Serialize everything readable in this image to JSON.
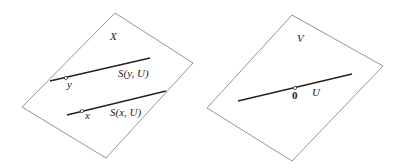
{
  "diagram": {
    "left_panel": {
      "plane_label": "X",
      "plane": [
        [
          115,
          13
        ],
        [
          193,
          63
        ],
        [
          106,
          158
        ],
        [
          22,
          107
        ]
      ],
      "lines": [
        {
          "label": "S(y, U)",
          "from": [
            50,
            81
          ],
          "to": [
            150,
            58
          ],
          "point": [
            66,
            78
          ],
          "point_label": "y"
        },
        {
          "label": "S(x, U)",
          "from": [
            67,
            115
          ],
          "to": [
            166,
            91
          ],
          "point": [
            82,
            111
          ],
          "point_label": "x"
        }
      ]
    },
    "right_panel": {
      "plane_label": "V",
      "plane": [
        [
          292,
          15
        ],
        [
          383,
          66
        ],
        [
          292,
          161
        ],
        [
          207,
          108
        ]
      ],
      "lines": [
        {
          "label": "U",
          "from": [
            238,
            101
          ],
          "to": [
            352,
            74
          ],
          "point": [
            295,
            88
          ],
          "point_label": "0"
        }
      ]
    },
    "colors": {
      "plane_edge": "#7a7a7a",
      "line": "#222222",
      "text": "#222222"
    }
  }
}
